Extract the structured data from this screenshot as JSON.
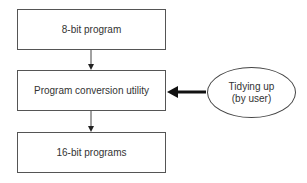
{
  "diagram": {
    "type": "flowchart",
    "nodes": [
      {
        "id": "box-1",
        "shape": "rectangle",
        "label": "8-bit program"
      },
      {
        "id": "box-2",
        "shape": "rectangle",
        "label": "Program conversion utility"
      },
      {
        "id": "box-3",
        "shape": "rectangle",
        "label": "16-bit programs"
      },
      {
        "id": "ellipse-1",
        "shape": "ellipse",
        "label_line1": "Tidying up",
        "label_line2": "(by user)"
      }
    ],
    "edges": [
      {
        "from": "box-1",
        "to": "box-2",
        "style": "thin",
        "direction": "down"
      },
      {
        "from": "box-2",
        "to": "box-3",
        "style": "thin",
        "direction": "down"
      },
      {
        "from": "ellipse-1",
        "to": "box-2",
        "style": "thick",
        "direction": "left"
      }
    ],
    "colors": {
      "stroke": "#555555",
      "text": "#333333",
      "background": "#ffffff",
      "thick_arrow": "#111111"
    }
  }
}
